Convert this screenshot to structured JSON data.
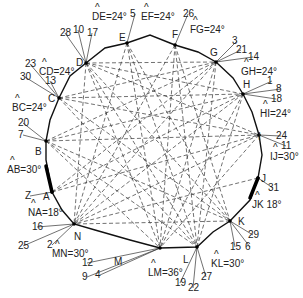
{
  "diagram": {
    "type": "closed traverse polygon with dashed sight lines",
    "polygon": [
      [
        52,
        192
      ],
      [
        46,
        160
      ],
      [
        46,
        141
      ],
      [
        50,
        120
      ],
      [
        59,
        98
      ],
      [
        70,
        76
      ],
      [
        86,
        63
      ],
      [
        105,
        48
      ],
      [
        127,
        43
      ],
      [
        150,
        35
      ],
      [
        175,
        45
      ],
      [
        198,
        52
      ],
      [
        216,
        62
      ],
      [
        233,
        78
      ],
      [
        243,
        94
      ],
      [
        252,
        112
      ],
      [
        259,
        135
      ],
      [
        262,
        155
      ],
      [
        258,
        178
      ],
      [
        250,
        200
      ],
      [
        230,
        221
      ],
      [
        213,
        232
      ],
      [
        197,
        247
      ],
      [
        160,
        248
      ],
      [
        130,
        240
      ],
      [
        95,
        230
      ],
      [
        74,
        224
      ],
      [
        62,
        210
      ]
    ],
    "thick_segments": [
      [
        [
          52,
          192
        ],
        [
          46,
          166
        ]
      ],
      [
        [
          258,
          178
        ],
        [
          250,
          198
        ]
      ]
    ],
    "stations": [
      {
        "id": "A",
        "x": 52,
        "y": 192,
        "label": "A",
        "lx": 43,
        "ly": 200
      },
      {
        "id": "B",
        "x": 46,
        "y": 141,
        "label": "B",
        "lx": 35,
        "ly": 155
      },
      {
        "id": "C",
        "x": 59,
        "y": 98,
        "label": "C",
        "lx": 48,
        "ly": 102
      },
      {
        "id": "D",
        "x": 86,
        "y": 63,
        "label": "D",
        "lx": 76,
        "ly": 66
      },
      {
        "id": "E",
        "x": 127,
        "y": 43,
        "label": "E",
        "lx": 119,
        "ly": 41
      },
      {
        "id": "F",
        "x": 175,
        "y": 45,
        "label": "F",
        "lx": 172,
        "ly": 38
      },
      {
        "id": "G",
        "x": 216,
        "y": 62,
        "label": "G",
        "lx": 210,
        "ly": 56
      },
      {
        "id": "H",
        "x": 243,
        "y": 94,
        "label": "H",
        "lx": 243,
        "ly": 88
      },
      {
        "id": "I",
        "x": 259,
        "y": 135,
        "label": "I",
        "lx": 258,
        "ly": 140
      },
      {
        "id": "J",
        "x": 258,
        "y": 178,
        "label": "J",
        "lx": 261,
        "ly": 182
      },
      {
        "id": "K",
        "x": 230,
        "y": 221,
        "label": "K",
        "lx": 238,
        "ly": 225
      },
      {
        "id": "L",
        "x": 197,
        "y": 247,
        "label": "L",
        "lx": 183,
        "ly": 263
      },
      {
        "id": "M",
        "x": 160,
        "y": 248,
        "label": "M",
        "lx": 114,
        "ly": 265
      },
      {
        "id": "N",
        "x": 74,
        "y": 224,
        "label": "N",
        "lx": 74,
        "ly": 240
      }
    ],
    "angle_labels": [
      {
        "text": "DE=24°",
        "x": 92,
        "y": 20
      },
      {
        "text": "EF=24°",
        "x": 141,
        "y": 20
      },
      {
        "text": "FG=24°",
        "x": 190,
        "y": 33
      },
      {
        "text": "GH=24°",
        "x": 241,
        "y": 75
      },
      {
        "text": "HI=24°",
        "x": 260,
        "y": 117
      },
      {
        "text": "IJ=30°",
        "x": 270,
        "y": 160
      },
      {
        "text": "JK 18°",
        "x": 252,
        "y": 208
      },
      {
        "text": "KL=30°",
        "x": 211,
        "y": 267
      },
      {
        "text": "LM=36°",
        "x": 148,
        "y": 276
      },
      {
        "text": "MN=30°",
        "x": 52,
        "y": 257
      },
      {
        "text": "NA=18°",
        "x": 28,
        "y": 216
      },
      {
        "text": "AB=30°",
        "x": 7,
        "y": 173
      },
      {
        "text": "BC=24°",
        "x": 12,
        "y": 111
      },
      {
        "text": "CD=24°",
        "x": 39,
        "y": 75
      }
    ],
    "sight_numbers": [
      {
        "text": "5",
        "x": 130,
        "y": 17,
        "to": "E"
      },
      {
        "text": "26",
        "x": 183,
        "y": 17,
        "to": "F"
      },
      {
        "text": "28",
        "x": 60,
        "y": 36,
        "to": "D"
      },
      {
        "text": "10",
        "x": 73,
        "y": 33,
        "to": "D"
      },
      {
        "text": "17",
        "x": 87,
        "y": 36,
        "to": "D"
      },
      {
        "text": "23",
        "x": 25,
        "y": 67,
        "to": "C"
      },
      {
        "text": "30",
        "x": 20,
        "y": 80,
        "to": "C"
      },
      {
        "text": "13",
        "x": 45,
        "y": 84,
        "to": "C"
      },
      {
        "text": "3",
        "x": 232,
        "y": 44,
        "to": "G"
      },
      {
        "text": "21",
        "x": 236,
        "y": 53,
        "to": "G"
      },
      {
        "text": "14",
        "x": 248,
        "y": 60,
        "to": "G"
      },
      {
        "text": "1",
        "x": 267,
        "y": 84,
        "to": "H"
      },
      {
        "text": "8",
        "x": 276,
        "y": 92,
        "to": "H"
      },
      {
        "text": "18",
        "x": 271,
        "y": 102,
        "to": "H"
      },
      {
        "text": "24",
        "x": 276,
        "y": 139,
        "to": "I"
      },
      {
        "text": "11",
        "x": 281,
        "y": 149,
        "to": "I"
      },
      {
        "text": "31",
        "x": 268,
        "y": 191,
        "to": "J"
      },
      {
        "text": "29",
        "x": 248,
        "y": 238,
        "to": "K"
      },
      {
        "text": "15",
        "x": 230,
        "y": 250,
        "to": "K"
      },
      {
        "text": "6",
        "x": 245,
        "y": 250,
        "to": "K"
      },
      {
        "text": "19",
        "x": 175,
        "y": 286,
        "to": "L"
      },
      {
        "text": "22",
        "x": 188,
        "y": 291,
        "to": "L"
      },
      {
        "text": "27",
        "x": 201,
        "y": 280,
        "to": "L"
      },
      {
        "text": "12",
        "x": 82,
        "y": 266,
        "to": "M"
      },
      {
        "text": "9",
        "x": 82,
        "y": 280,
        "to": "M"
      },
      {
        "text": "4",
        "x": 95,
        "y": 278,
        "to": "M"
      },
      {
        "text": "2",
        "x": 47,
        "y": 248,
        "to": "N"
      },
      {
        "text": "16",
        "x": 32,
        "y": 230,
        "to": "N"
      },
      {
        "text": "25",
        "x": 18,
        "y": 249,
        "to": "N"
      },
      {
        "text": "20",
        "x": 18,
        "y": 126,
        "to": "B"
      },
      {
        "text": "7",
        "x": 18,
        "y": 138,
        "to": "B"
      },
      {
        "text": "Z",
        "x": 25,
        "y": 199,
        "to": "A"
      }
    ],
    "dashed_lines": [
      [
        "D",
        "G"
      ],
      [
        "D",
        "H"
      ],
      [
        "D",
        "I"
      ],
      [
        "D",
        "K"
      ],
      [
        "D",
        "L"
      ],
      [
        "D",
        "M"
      ],
      [
        "D",
        "N"
      ],
      [
        "C",
        "G"
      ],
      [
        "C",
        "H"
      ],
      [
        "C",
        "I"
      ],
      [
        "C",
        "K"
      ],
      [
        "C",
        "L"
      ],
      [
        "B",
        "G"
      ],
      [
        "B",
        "H"
      ],
      [
        "B",
        "I"
      ],
      [
        "B",
        "K"
      ],
      [
        "B",
        "L"
      ],
      [
        "B",
        "M"
      ],
      [
        "A",
        "G"
      ],
      [
        "A",
        "H"
      ],
      [
        "A",
        "I"
      ],
      [
        "E",
        "M"
      ],
      [
        "E",
        "L"
      ],
      [
        "E",
        "K"
      ],
      [
        "E",
        "N"
      ],
      [
        "F",
        "M"
      ],
      [
        "F",
        "N"
      ],
      [
        "F",
        "K"
      ],
      [
        "F",
        "L"
      ],
      [
        "G",
        "M"
      ],
      [
        "G",
        "N"
      ],
      [
        "G",
        "L"
      ],
      [
        "H",
        "N"
      ],
      [
        "H",
        "M"
      ],
      [
        "H",
        "L"
      ],
      [
        "I",
        "N"
      ],
      [
        "I",
        "M"
      ],
      [
        "K",
        "N"
      ],
      [
        "J",
        "N"
      ]
    ]
  }
}
